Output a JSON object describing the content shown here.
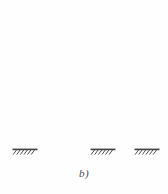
{
  "figure": {
    "caption": "b)",
    "alt_description": "Plane frame: four storeys, two bays, three fixed base supports",
    "background_color": "#fefefe",
    "line_color": "#4a4a4a",
    "line_color_dark": "#3a3a3a",
    "caption_color": "#4a4a4a"
  },
  "chart_data": {
    "type": "diagram",
    "title": "b)",
    "subtitle": "",
    "xlabel": "",
    "ylabel": "",
    "diagram_kind": "structural-frame-elevation",
    "storeys": 4,
    "bays": 2,
    "supports": {
      "count": 3,
      "kind": "fixed",
      "symbol": "hatched-ground",
      "base_y": 149,
      "items": [
        {
          "name": "support-left",
          "x": 24,
          "plate_x1": 12,
          "plate_x2": 37
        },
        {
          "name": "support-middle",
          "x": 102,
          "plate_x1": 90,
          "plate_x2": 115
        },
        {
          "name": "support-right",
          "x": 146,
          "plate_x1": 134,
          "plate_x2": 159
        }
      ]
    },
    "columns": [
      {
        "name": "column-left",
        "x": 24,
        "y_top": 14,
        "y_bottom": 149
      },
      {
        "name": "column-middle",
        "x": 102,
        "y_top": 14,
        "y_bottom": 149
      },
      {
        "name": "column-right",
        "x": 146,
        "y_top": 14,
        "y_bottom": 118
      }
    ],
    "beams": [
      {
        "name": "beam-level-4-roof",
        "level": 4,
        "y": 14,
        "x1": 24,
        "x2": 146,
        "label": "roof beam"
      },
      {
        "name": "beam-level-3",
        "level": 3,
        "y": 52,
        "x1": 24,
        "x2": 146,
        "label": "3rd floor beam"
      },
      {
        "name": "beam-level-2",
        "level": 2,
        "y": 85,
        "x1": 24,
        "x2": 146,
        "label": "2nd floor beam"
      },
      {
        "name": "beam-level-1",
        "level": 1,
        "y": 118,
        "x1": 24,
        "x2": 146,
        "label": "1st floor beam"
      }
    ],
    "bay_spans_px": [
      78,
      44
    ],
    "storey_heights_px": [
      31,
      33,
      33,
      38
    ],
    "grid": false,
    "legend": null,
    "annotations": [
      {
        "name": "figure-label",
        "text": "b)",
        "x": 84,
        "y": 178
      }
    ]
  }
}
